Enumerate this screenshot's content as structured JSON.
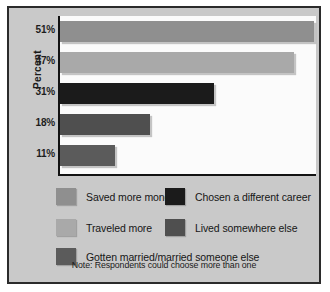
{
  "chart_data": {
    "type": "bar",
    "orientation": "horizontal",
    "title": "",
    "xlabel": "",
    "ylabel": "Percent",
    "categories": [
      "Saved more money",
      "Traveled more",
      "Chosen a different career",
      "Lived somewhere else",
      "Gotten married/married someone else"
    ],
    "values": [
      51,
      47,
      31,
      18,
      11
    ],
    "tick_labels": [
      "51%",
      "47%",
      "31%",
      "18%",
      "11%"
    ],
    "xlim": [
      0,
      51
    ],
    "grid": false,
    "legend_position": "bottom",
    "annotation": "Note: Respondents could choose more than one",
    "colors": [
      "#8f8f8f",
      "#a9a9a9",
      "#1b1b1b",
      "#4f4f4f",
      "#5b5b5b"
    ]
  },
  "axis": {
    "ylabel": "Percent",
    "ticks": [
      {
        "label": "51%"
      },
      {
        "label": "47%"
      },
      {
        "label": "31%"
      },
      {
        "label": "18%"
      },
      {
        "label": "11%"
      }
    ]
  },
  "bars": [
    {
      "label": "Saved more money",
      "value": 51,
      "color": "#8f8f8f"
    },
    {
      "label": "Traveled more",
      "value": 47,
      "color": "#a9a9a9"
    },
    {
      "label": "Chosen a different career",
      "value": 31,
      "color": "#1b1b1b"
    },
    {
      "label": "Lived somewhere else",
      "value": 18,
      "color": "#4f4f4f"
    },
    {
      "label": "Gotten married/married someone else",
      "value": 11,
      "color": "#5b5b5b"
    }
  ],
  "legend": {
    "entries": [
      {
        "label": "Saved more money",
        "color": "#8f8f8f"
      },
      {
        "label": "Chosen a different career",
        "color": "#1b1b1b"
      },
      {
        "label": "Traveled more",
        "color": "#a9a9a9"
      },
      {
        "label": "Lived somewhere else",
        "color": "#4f4f4f"
      },
      {
        "label": "Gotten married/married someone else",
        "color": "#5b5b5b"
      }
    ],
    "note": "Note: Respondents could choose more than one"
  }
}
